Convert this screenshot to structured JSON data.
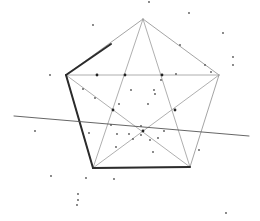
{
  "diagram": {
    "type": "pentagon-with-pentagram",
    "background": "#ffffff",
    "colors": {
      "thin_line": "#9a9a9a",
      "thick_line": "#2b2b2b",
      "dot": "#555555",
      "intersection": "#222222"
    },
    "vertices": {
      "top": [
        143,
        19
      ],
      "right": [
        219,
        75
      ],
      "bottom_right": [
        190,
        167
      ],
      "bottom_left": [
        93,
        168
      ],
      "left": [
        66,
        75
      ]
    },
    "thick_edges": [
      [
        [
          66,
          75
        ],
        [
          111,
          44
        ]
      ],
      [
        [
          66,
          75
        ],
        [
          93,
          168
        ]
      ],
      [
        [
          93,
          168
        ],
        [
          190,
          167
        ]
      ]
    ],
    "cross_line": [
      [
        14,
        116
      ],
      [
        249,
        136
      ]
    ],
    "intersections": [
      [
        97,
        75
      ],
      [
        125,
        75
      ],
      [
        162,
        75
      ],
      [
        113,
        110
      ],
      [
        175,
        110
      ],
      [
        143,
        131
      ]
    ],
    "dots": [
      [
        93,
        25
      ],
      [
        149,
        2
      ],
      [
        189,
        13
      ],
      [
        223,
        33
      ],
      [
        233,
        57
      ],
      [
        233,
        65
      ],
      [
        50,
        75
      ],
      [
        83,
        89
      ],
      [
        95,
        98
      ],
      [
        131,
        90
      ],
      [
        154,
        90
      ],
      [
        161,
        80
      ],
      [
        176,
        74
      ],
      [
        211,
        72
      ],
      [
        205,
        65
      ],
      [
        180,
        45
      ],
      [
        119,
        104
      ],
      [
        155,
        94
      ],
      [
        148,
        104
      ],
      [
        35,
        131
      ],
      [
        89,
        133
      ],
      [
        111,
        125
      ],
      [
        117,
        134
      ],
      [
        129,
        134
      ],
      [
        133,
        139
      ],
      [
        141,
        135
      ],
      [
        150,
        140
      ],
      [
        158,
        138
      ],
      [
        153,
        152
      ],
      [
        116,
        147
      ],
      [
        164,
        131
      ],
      [
        141,
        126
      ],
      [
        199,
        150
      ],
      [
        51,
        176
      ],
      [
        86,
        178
      ],
      [
        114,
        179
      ],
      [
        78,
        194
      ],
      [
        78,
        200
      ],
      [
        77,
        205
      ],
      [
        226,
        213
      ]
    ]
  }
}
